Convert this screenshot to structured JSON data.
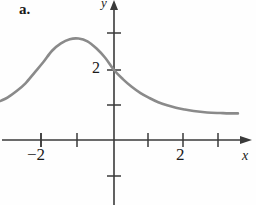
{
  "figure": {
    "part_label": "a.",
    "axes": {
      "x_label": "x",
      "y_label": "y",
      "x_tick_labels": [
        "−2",
        "2"
      ],
      "y_tick_labels": [
        "2"
      ]
    },
    "colors": {
      "curve": "#8a8a8a",
      "axis": "#3a3a3a",
      "text": "#1a1a1a",
      "background": "#fefefe"
    }
  },
  "chart_data": {
    "type": "line",
    "title": "",
    "xlabel": "x",
    "ylabel": "y",
    "grid": false,
    "legend": null,
    "xlim": [
      -3.2,
      3.6
    ],
    "ylim": [
      -1.85,
      4.0
    ],
    "xticks": [
      -3,
      -2,
      -1,
      0,
      1,
      2,
      3
    ],
    "xtick_labels": [
      "",
      "−2",
      "",
      "",
      "",
      "2",
      ""
    ],
    "yticks": [
      -1,
      1,
      2,
      3
    ],
    "ytick_labels": [
      "",
      "",
      "2",
      ""
    ],
    "annotations": [
      {
        "label": "y-intercept",
        "x": 0,
        "y": 2
      },
      {
        "label": "local maximum",
        "x": -1,
        "y": 2.9
      }
    ],
    "series": [
      {
        "name": "f(x)",
        "x": [
          -3.2,
          -3.0,
          -2.75,
          -2.5,
          -2.25,
          -2.0,
          -1.75,
          -1.5,
          -1.25,
          -1.0,
          -0.75,
          -0.5,
          -0.25,
          0.0,
          0.25,
          0.5,
          0.75,
          1.0,
          1.25,
          1.5,
          1.75,
          2.0,
          2.25,
          2.5,
          2.75,
          3.0,
          3.25,
          3.5
        ],
        "y": [
          1.12,
          1.22,
          1.4,
          1.62,
          1.92,
          2.22,
          2.55,
          2.76,
          2.88,
          2.9,
          2.82,
          2.62,
          2.35,
          2.0,
          1.74,
          1.52,
          1.34,
          1.2,
          1.08,
          0.99,
          0.92,
          0.87,
          0.83,
          0.8,
          0.78,
          0.77,
          0.76,
          0.76
        ]
      }
    ]
  }
}
